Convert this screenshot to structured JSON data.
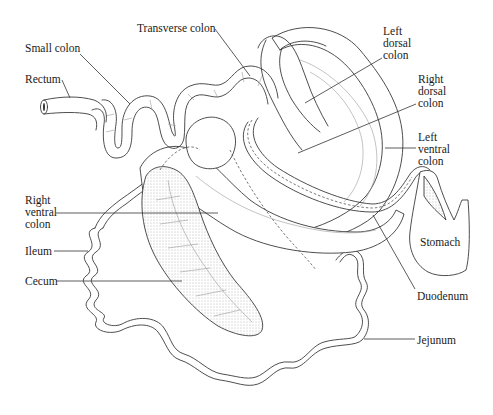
{
  "figure": {
    "labels": [
      {
        "id": "small-colon",
        "text": "Small colon",
        "x": 22,
        "y": 11
      },
      {
        "id": "transverse-colon",
        "text": "Transverse colon",
        "x": 137,
        "y": 20
      },
      {
        "id": "rectum",
        "text": "Rectum",
        "x": 24,
        "y": 71
      },
      {
        "id": "left-dorsal-colon",
        "text": "Left\ndorsal\ncolon",
        "x": 383,
        "y": 25
      },
      {
        "id": "right-dorsal-colon",
        "text": "Right\ndorsal\ncolon",
        "x": 418,
        "y": 73
      },
      {
        "id": "left-ventral-colon",
        "text": "Left\nventral\ncolon",
        "x": 418,
        "y": 131
      },
      {
        "id": "right-ventral-colon",
        "text": "Right\nventral\ncolon",
        "x": 24,
        "y": 194
      },
      {
        "id": "ileum",
        "text": "Ileum",
        "x": 24,
        "y": 245
      },
      {
        "id": "cecum",
        "text": "Cecum",
        "x": 24,
        "y": 275
      },
      {
        "id": "stomach",
        "text": "Stomach",
        "x": 420,
        "y": 236
      },
      {
        "id": "duodenum",
        "text": "Duodenum",
        "x": 417,
        "y": 289
      },
      {
        "id": "jejunum",
        "text": "Jejunum",
        "x": 417,
        "y": 334
      }
    ]
  }
}
